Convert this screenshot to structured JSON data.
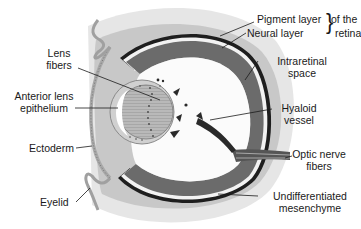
{
  "figure": {
    "colors": {
      "background": "#ffffff",
      "mesenchyme": "#e4e4e4",
      "ectoderm_band": "#c9c9c9",
      "neural_layer": "#6e6e6e",
      "pigment_layer": "#1e1e1e",
      "intraretinal_space": "#f4f4f4",
      "lens": "#b8b8b8",
      "vitreous": "#fbfbfb",
      "label_text": "#1a1a1a"
    }
  },
  "labels": {
    "pigment_layer": "Pigment layer",
    "neural_layer": "Neural layer",
    "of_the": "of the",
    "retina": "retina",
    "intraretinal_1": "Intraretinal",
    "intraretinal_2": "space",
    "lens_fibers_1": "Lens",
    "lens_fibers_2": "fibers",
    "anterior_lens_1": "Anterior lens",
    "anterior_lens_2": "epithelium",
    "hyaloid_1": "Hyaloid",
    "hyaloid_2": "vessel",
    "ectoderm": "Ectoderm",
    "optic_nerve_1": "Optic nerve",
    "optic_nerve_2": "fibers",
    "eyelid": "Eyelid",
    "mesenchyme_1": "Undifferentiated",
    "mesenchyme_2": "mesenchyme"
  }
}
